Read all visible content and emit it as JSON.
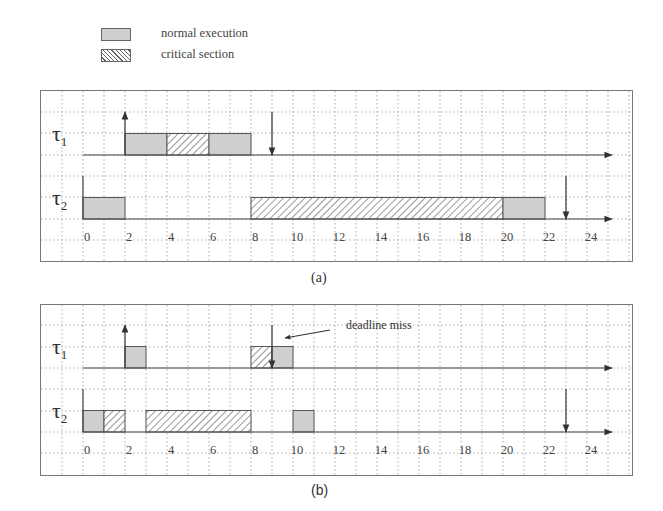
{
  "legend": {
    "items": [
      {
        "key": "normal",
        "label": "normal execution"
      },
      {
        "key": "critical",
        "label": "critical section"
      }
    ]
  },
  "colors": {
    "normal_fill": "#cfcfcf",
    "line": "#444444",
    "grid": "#9a9a9a"
  },
  "panels": [
    {
      "id": "a",
      "caption": "(a)",
      "tasks": [
        {
          "name": "τ",
          "sub": "1",
          "release": 2,
          "deadline": 9,
          "segments": [
            {
              "start": 2,
              "end": 4,
              "type": "normal"
            },
            {
              "start": 4,
              "end": 6,
              "type": "critical"
            },
            {
              "start": 6,
              "end": 8,
              "type": "normal"
            }
          ]
        },
        {
          "name": "τ",
          "sub": "2",
          "release": 0,
          "deadline": 23,
          "segments": [
            {
              "start": 0,
              "end": 2,
              "type": "normal"
            },
            {
              "start": 8,
              "end": 20,
              "type": "critical"
            },
            {
              "start": 20,
              "end": 22,
              "type": "normal"
            }
          ]
        }
      ],
      "ticks": [
        "0",
        "2",
        "4",
        "6",
        "8",
        "10",
        "12",
        "14",
        "16",
        "18",
        "20",
        "22",
        "24"
      ]
    },
    {
      "id": "b",
      "caption": "(b)",
      "annotation": "deadline miss",
      "tasks": [
        {
          "name": "τ",
          "sub": "1",
          "release": 2,
          "deadline": 9,
          "segments": [
            {
              "start": 2,
              "end": 3,
              "type": "normal"
            },
            {
              "start": 8,
              "end": 9,
              "type": "critical"
            },
            {
              "start": 9,
              "end": 10,
              "type": "normal"
            }
          ]
        },
        {
          "name": "τ",
          "sub": "2",
          "release": 0,
          "deadline": 23,
          "segments": [
            {
              "start": 0,
              "end": 1,
              "type": "normal"
            },
            {
              "start": 1,
              "end": 2,
              "type": "critical"
            },
            {
              "start": 3,
              "end": 8,
              "type": "critical"
            },
            {
              "start": 10,
              "end": 11,
              "type": "normal"
            }
          ]
        }
      ],
      "ticks": [
        "0",
        "2",
        "4",
        "6",
        "8",
        "10",
        "12",
        "14",
        "16",
        "18",
        "20",
        "22",
        "24"
      ]
    }
  ]
}
